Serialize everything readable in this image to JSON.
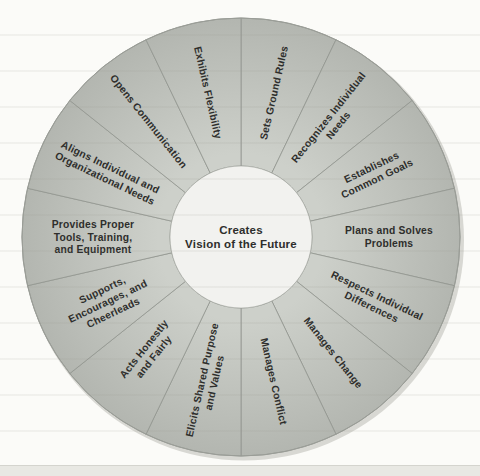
{
  "figure": {
    "title_center": {
      "line1": "Creates",
      "line2": "Vision of the Future"
    },
    "segments": [
      {
        "label": "Sets Ground Rules",
        "lines": [
          "Sets Ground Rules"
        ]
      },
      {
        "label": "Recognizes Individual Needs",
        "lines": [
          "Recognizes Individual",
          "Needs"
        ]
      },
      {
        "label": "Establishes Common Goals",
        "lines": [
          "Establishes",
          "Common Goals"
        ]
      },
      {
        "label": "Plans and Solves Problems",
        "lines": [
          "Plans and Solves",
          "Problems"
        ]
      },
      {
        "label": "Respects Individual Differences",
        "lines": [
          "Respects Individual",
          "Differences"
        ]
      },
      {
        "label": "Manages Change",
        "lines": [
          "Manages Change"
        ]
      },
      {
        "label": "Manages Conflict",
        "lines": [
          "Manages Conflict"
        ]
      },
      {
        "label": "Elicits Shared Purpose and Values",
        "lines": [
          "Elicits Shared Purpose",
          "and Values"
        ]
      },
      {
        "label": "Acts Honestly and Fairly",
        "lines": [
          "Acts Honestly",
          "and Fairly"
        ]
      },
      {
        "label": "Supports, Encourages, and Cheerleads",
        "lines": [
          "Supports,",
          "Encourages, and",
          "Cheerleads"
        ]
      },
      {
        "label": "Provides Proper Tools, Training, and Equipment",
        "lines": [
          "Provides Proper",
          "Tools, Training,",
          "and Equipment"
        ]
      },
      {
        "label": "Aligns Individual and Organizational Needs",
        "lines": [
          "Aligns Individual and",
          "Organizational Needs"
        ]
      },
      {
        "label": "Opens Communication",
        "lines": [
          "Opens Communication"
        ]
      },
      {
        "label": "Exhibits Flexibility",
        "lines": [
          "Exhibits Flexibility"
        ]
      }
    ],
    "colors": {
      "background": "#fbfbf8",
      "segment_inner": "#cdd0ca",
      "segment_outer": "#b3b6b0",
      "divider": "#92958f",
      "outline": "#9a9d97",
      "shadow": "#d8d8d3",
      "center_fill": "#f2f2ef",
      "center_stroke": "#a3a6a0",
      "text": "#2e2e2c"
    }
  }
}
